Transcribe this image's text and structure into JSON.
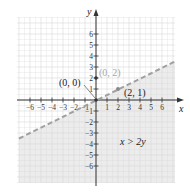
{
  "chart_data": {
    "type": "line",
    "title": "",
    "xlabel": "x",
    "ylabel": "y",
    "xlim": [
      -7,
      7
    ],
    "ylim": [
      -7.5,
      7.5
    ],
    "grid": true,
    "x_ticks": [
      "-6",
      "-5",
      "-4",
      "-3",
      "-2",
      "-1",
      "1",
      "2",
      "3",
      "4",
      "5",
      "6"
    ],
    "y_ticks": [
      "6",
      "5",
      "4",
      "3",
      "2",
      "1",
      "-1",
      "-2",
      "-3",
      "-4",
      "-5",
      "-6"
    ],
    "series": [
      {
        "name": "boundary y = x/2",
        "style": "dashed",
        "x": [
          -7,
          7
        ],
        "y": [
          -3.5,
          3.5
        ]
      }
    ],
    "shaded_region": "below the line (x > 2y)",
    "points": [
      {
        "label": "(0, 0)",
        "x": 0,
        "y": 0
      },
      {
        "label": "(2, 1)",
        "x": 2,
        "y": 1
      },
      {
        "label": "(0, 2)",
        "x": 0,
        "y": 2
      }
    ],
    "annotations": [
      "x > 2y"
    ]
  },
  "labels": {
    "x_axis": "x",
    "y_axis": "y",
    "origin_point": "(0, 0)",
    "point_2_1": "(2, 1)",
    "point_0_2": "(0, 2)",
    "inequality": "x > 2y",
    "xticks": [
      "−6",
      "−5",
      "−4",
      "−3",
      "−2",
      "−1",
      "1",
      "2",
      "3",
      "4",
      "5",
      "6"
    ],
    "yticks": [
      "6",
      "5",
      "4",
      "3",
      "2",
      "1",
      "−1",
      "−2",
      "−3",
      "−4",
      "−5",
      "−6"
    ]
  },
  "colors": {
    "shade": "#e9e9e9",
    "grid": "#d4d4d4",
    "axis": "#333333",
    "dash": "#a0a0a0",
    "gray_label": "#a8a8a8"
  }
}
